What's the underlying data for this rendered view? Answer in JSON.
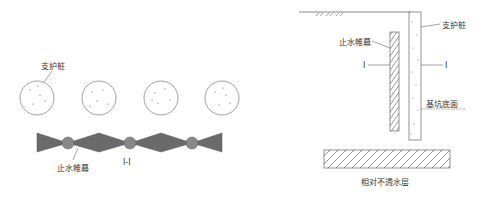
{
  "plan_view": {
    "pile_label": "支护桩",
    "curtain_label": "止水帷幕",
    "section_label": "I-I",
    "pile_count": 4
  },
  "section_view": {
    "pile_label": "支护桩",
    "curtain_label": "止水帷幕",
    "section_mark_left": "I",
    "section_mark_right": "I",
    "pit_bottom_label": "基坑底面",
    "impermeable_layer_label": "相对不透水层"
  },
  "colors": {
    "line": "#555555",
    "fill_dark": "#6a6a6a",
    "text": "#333333"
  }
}
